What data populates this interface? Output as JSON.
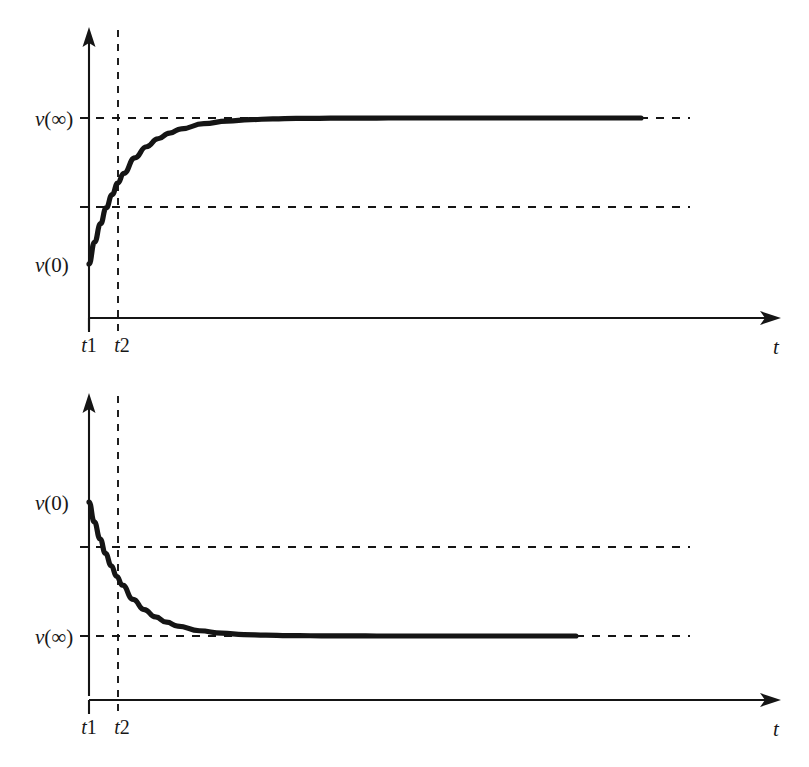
{
  "figure": {
    "background_color": "#ffffff",
    "ink_color": "#151515",
    "panels": [
      {
        "id": "rising",
        "name": "rising-exponential-panel",
        "y_axis_label": "",
        "x_axis_label": "t",
        "value_labels": {
          "initial": "v(0)",
          "final": "v(∞)"
        },
        "tick_labels": [
          "t1",
          "t2"
        ],
        "description": "Charging exponential rising from v(0) toward asymptote v(∞)"
      },
      {
        "id": "falling",
        "name": "falling-exponential-panel",
        "y_axis_label": "",
        "x_axis_label": "t",
        "value_labels": {
          "initial": "v(0)",
          "final": "v(∞)"
        },
        "tick_labels": [
          "t1",
          "t2"
        ],
        "description": "Discharging exponential decaying from v(0) toward asymptote v(∞)"
      }
    ]
  },
  "chart_data": [
    {
      "type": "line",
      "id": "rising-exponential",
      "title": "",
      "xlabel": "t",
      "ylabel": "v",
      "grid": false,
      "legend": null,
      "axis_style": "arrowed-half-axes",
      "xlim": [
        0,
        1
      ],
      "ylim": [
        0,
        1
      ],
      "tick_labels_x": [
        "t1",
        "t2"
      ],
      "tick_values_x": [
        0.0,
        0.042
      ],
      "annotations": [
        {
          "text": "v(∞)",
          "y": 1.0,
          "type": "asymptote-label"
        },
        {
          "text": "v(0)",
          "y": 0.0,
          "type": "initial-value-label"
        }
      ],
      "reference_lines": [
        {
          "orientation": "horizontal",
          "label": "v(∞)",
          "y": 1.0,
          "style": "dashed"
        },
        {
          "orientation": "horizontal",
          "label": "0.632 level (one time constant)",
          "y": 0.553,
          "style": "dashed"
        },
        {
          "orientation": "vertical",
          "label": "t2",
          "x": 0.042,
          "style": "dashed"
        }
      ],
      "series": [
        {
          "name": "v(t) = v(∞) + [v(0) - v(∞)]e^(-t/τ)",
          "x": [
            0.0,
            0.01,
            0.021,
            0.031,
            0.042,
            0.052,
            0.063,
            0.083,
            0.104,
            0.125,
            0.146,
            0.167,
            0.208,
            0.25,
            0.292,
            0.333,
            0.375,
            0.417,
            0.458,
            0.5,
            0.542,
            0.583,
            0.625,
            0.667,
            0.708,
            0.75,
            0.792,
            0.833,
            0.875,
            0.917,
            0.958,
            1.0
          ],
          "y": [
            0.0,
            0.149,
            0.276,
            0.384,
            0.476,
            0.554,
            0.621,
            0.727,
            0.803,
            0.858,
            0.897,
            0.926,
            0.961,
            0.979,
            0.989,
            0.994,
            0.997,
            0.998,
            0.999,
            0.999,
            1.0,
            1.0,
            1.0,
            1.0,
            1.0,
            1.0,
            1.0,
            1.0,
            1.0,
            1.0,
            1.0,
            1.0
          ]
        }
      ]
    },
    {
      "type": "line",
      "id": "falling-exponential",
      "title": "",
      "xlabel": "t",
      "ylabel": "v",
      "grid": false,
      "legend": null,
      "axis_style": "arrowed-half-axes",
      "xlim": [
        0,
        1
      ],
      "ylim": [
        0,
        1
      ],
      "tick_labels_x": [
        "t1",
        "t2"
      ],
      "tick_values_x": [
        0.0,
        0.042
      ],
      "annotations": [
        {
          "text": "v(0)",
          "y": 1.0,
          "type": "initial-value-label"
        },
        {
          "text": "v(∞)",
          "y": 0.0,
          "type": "asymptote-label"
        }
      ],
      "reference_lines": [
        {
          "orientation": "horizontal",
          "label": "0.368 level (one time constant)",
          "y": 0.665,
          "style": "dashed"
        },
        {
          "orientation": "horizontal",
          "label": "v(∞)",
          "y": 0.0,
          "style": "dashed"
        },
        {
          "orientation": "vertical",
          "label": "t2",
          "x": 0.042,
          "style": "dashed"
        }
      ],
      "series": [
        {
          "name": "v(t) = v(∞) + [v(0) - v(∞)]e^(-t/τ)",
          "x": [
            0.0,
            0.01,
            0.021,
            0.031,
            0.042,
            0.052,
            0.063,
            0.083,
            0.104,
            0.125,
            0.146,
            0.167,
            0.208,
            0.25,
            0.292,
            0.333,
            0.375,
            0.417,
            0.458,
            0.5,
            0.542,
            0.583,
            0.625,
            0.667,
            0.708,
            0.75,
            0.792,
            0.833,
            0.875,
            0.917
          ],
          "y": [
            1.0,
            0.851,
            0.724,
            0.616,
            0.524,
            0.446,
            0.379,
            0.273,
            0.197,
            0.142,
            0.103,
            0.074,
            0.039,
            0.021,
            0.011,
            0.006,
            0.003,
            0.002,
            0.001,
            0.001,
            0.0,
            0.0,
            0.0,
            0.0,
            0.0,
            0.0,
            0.0,
            0.0,
            0.0,
            0.0
          ]
        }
      ]
    }
  ]
}
